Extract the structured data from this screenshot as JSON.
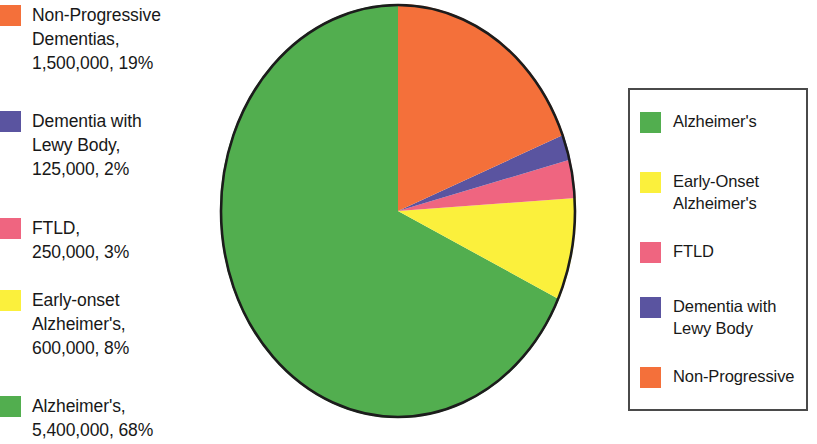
{
  "chart_data": {
    "type": "pie",
    "title": "",
    "total": 7875000,
    "start_angle_deg": 0,
    "direction": "counterclockwise",
    "categories": [
      "Alzheimer's",
      "Early-Onset Alzheimer's",
      "FTLD",
      "Dementia with Lewy Body",
      "Non-Progressive Dementias"
    ],
    "values": [
      5400000,
      600000,
      250000,
      125000,
      1500000
    ],
    "percentages": [
      68,
      8,
      3,
      2,
      19
    ],
    "colors": [
      "#52AE4F",
      "#FBF03C",
      "#EF6580",
      "#5A54A0",
      "#F4703A"
    ],
    "legend_position": "right",
    "grid": false
  },
  "data_labels": [
    {
      "color": "#F4703A",
      "swatch_name": "swatch-non-progressive",
      "text": "Non-Progressive\nDementias,\n1,500,000, 19%",
      "top": 3
    },
    {
      "color": "#5A54A0",
      "swatch_name": "swatch-lewy-body",
      "text": "Dementia with\nLewy Body,\n125,000, 2%",
      "top": 109
    },
    {
      "color": "#EF6580",
      "swatch_name": "swatch-ftld",
      "text": "FTLD,\n250,000, 3%",
      "top": 216
    },
    {
      "color": "#FBF03C",
      "swatch_name": "swatch-early-onset",
      "text": "Early-onset\nAlzheimer's,\n600,000, 8%",
      "top": 288
    },
    {
      "color": "#52AE4F",
      "swatch_name": "swatch-alzheimers",
      "text": "Alzheimer's,\n5,400,000, 68%",
      "top": 394
    }
  ],
  "legend": {
    "items": [
      {
        "color": "#52AE4F",
        "swatch_name": "legend-swatch-alzheimers",
        "label": "Alzheimer's",
        "top": 20
      },
      {
        "color": "#FBF03C",
        "swatch_name": "legend-swatch-early-onset",
        "label": "Early-Onset\nAlzheimer's",
        "top": 80
      },
      {
        "color": "#EF6580",
        "swatch_name": "legend-swatch-ftld",
        "label": "FTLD",
        "top": 150
      },
      {
        "color": "#5A54A0",
        "swatch_name": "legend-swatch-lewy-body",
        "label": "Dementia with\nLewy Body",
        "top": 205
      },
      {
        "color": "#F4703A",
        "swatch_name": "legend-swatch-non-progressive",
        "label": "Non-Progressive",
        "top": 275
      }
    ]
  },
  "pie_geometry": {
    "cx": 195,
    "cy": 207,
    "rx": 178,
    "ry": 207,
    "outline_color": "#1c1c1c"
  }
}
